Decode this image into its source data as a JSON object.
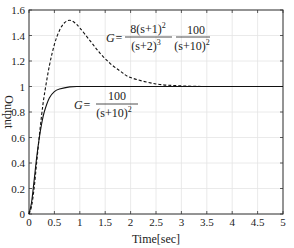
{
  "chart_data": {
    "type": "line",
    "title": "",
    "xlabel": "Time[sec]",
    "ylabel": "Output",
    "xlim": [
      0,
      5
    ],
    "ylim": [
      0,
      1.6
    ],
    "grid": true,
    "xticks": [
      "0",
      "0.5",
      "1",
      "1.5",
      "2",
      "2.5",
      "3",
      "3.5",
      "4",
      "4.5",
      "5"
    ],
    "yticks": [
      "0",
      "0.2",
      "0.4",
      "0.6",
      "0.8",
      "1",
      "1.2",
      "1.4",
      "1.6"
    ],
    "series": [
      {
        "name": "G = 100/(s+10)^2",
        "style": "solid",
        "x": [
          0,
          0.05,
          0.1,
          0.15,
          0.2,
          0.25,
          0.3,
          0.4,
          0.5,
          0.6,
          0.8,
          1.0,
          1.5,
          2,
          3,
          4,
          5
        ],
        "y": [
          0,
          0.09,
          0.26,
          0.44,
          0.59,
          0.71,
          0.8,
          0.91,
          0.96,
          0.98,
          0.997,
          1.0,
          1.0,
          1.0,
          1.0,
          1.0,
          1.0
        ]
      },
      {
        "name": "G = 8(s+1)^2/(s+2)^3 · 100/(s+10)^2",
        "style": "dashed",
        "x": [
          0,
          0.05,
          0.1,
          0.15,
          0.2,
          0.25,
          0.3,
          0.4,
          0.5,
          0.6,
          0.7,
          0.8,
          0.9,
          1.0,
          1.2,
          1.4,
          1.6,
          1.8,
          2.0,
          2.5,
          3.0,
          3.5,
          4,
          5
        ],
        "y": [
          0,
          0.06,
          0.2,
          0.4,
          0.6,
          0.78,
          0.93,
          1.16,
          1.33,
          1.44,
          1.5,
          1.52,
          1.5,
          1.46,
          1.36,
          1.26,
          1.18,
          1.12,
          1.07,
          1.02,
          1.005,
          1.0,
          1.0,
          1.0
        ]
      }
    ],
    "annotations": [
      {
        "label": "G=",
        "num1": "8(s+1)",
        "num1_exp": "2",
        "den1": "(s+2)",
        "den1_exp": "3",
        "num2": "100",
        "den2": "(s+10)",
        "den2_exp": "2"
      },
      {
        "label": "G=",
        "num": "100",
        "den": "(s+10)",
        "den_exp": "2"
      }
    ]
  }
}
